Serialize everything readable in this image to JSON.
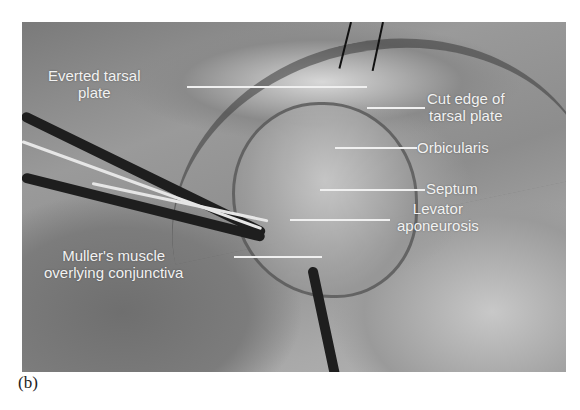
{
  "figure": {
    "panel_label": "(b)",
    "labels": [
      {
        "id": "everted-tarsal-plate",
        "lines": [
          "Everted tarsal",
          "plate"
        ]
      },
      {
        "id": "cut-edge-tarsal-plate",
        "lines": [
          "Cut edge of",
          "tarsal plate"
        ]
      },
      {
        "id": "orbicularis",
        "lines": [
          "Orbicularis"
        ]
      },
      {
        "id": "septum",
        "lines": [
          "Septum"
        ]
      },
      {
        "id": "levator-aponeurosis",
        "lines": [
          "Levator",
          "aponeurosis"
        ]
      },
      {
        "id": "mullers-muscle",
        "lines": [
          "Muller's muscle",
          "overlying conjunctiva"
        ]
      }
    ]
  }
}
